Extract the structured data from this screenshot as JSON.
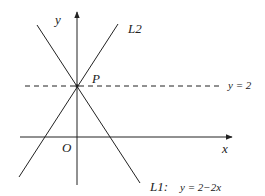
{
  "diagram": {
    "labels": {
      "y_axis": "y",
      "x_axis": "x",
      "origin": "O",
      "point": "P",
      "line2": "L2",
      "line1": "L1:",
      "line1_eq": "y = 2−2x",
      "dashed_eq": "y = 2"
    },
    "colors": {
      "stroke": "#222222",
      "background": "#ffffff"
    }
  }
}
